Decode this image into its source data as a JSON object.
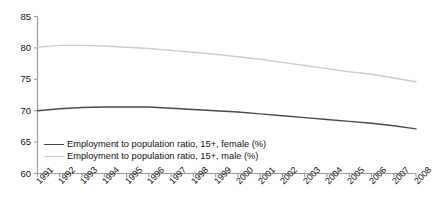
{
  "chart_data": {
    "type": "line",
    "title": "",
    "xlabel": "",
    "ylabel": "",
    "ylim": [
      60,
      85
    ],
    "yticks": [
      60,
      65,
      70,
      75,
      80,
      85
    ],
    "grid": false,
    "legend_position": "bottom-left",
    "x": [
      1991,
      1992,
      1993,
      1994,
      1995,
      1996,
      1997,
      1998,
      1999,
      2000,
      2001,
      2002,
      2003,
      2004,
      2005,
      2006,
      2007,
      2008
    ],
    "categories": [
      "1991",
      "1992",
      "1993",
      "1994",
      "1995",
      "1996",
      "1997",
      "1998",
      "1999",
      "2000",
      "2001",
      "2002",
      "2003",
      "2004",
      "2005",
      "2006",
      "2007",
      "2008"
    ],
    "series": [
      {
        "name": "Employment to population ratio, 15+, female (%)",
        "color": "#4a4a4a",
        "values": [
          70.0,
          70.3,
          70.5,
          70.6,
          70.6,
          70.6,
          70.4,
          70.2,
          70.0,
          69.8,
          69.5,
          69.2,
          68.9,
          68.6,
          68.3,
          68.0,
          67.6,
          67.1
        ]
      },
      {
        "name": "Employment to population ratio, 15+, male (%)",
        "color": "#cdcdcd",
        "values": [
          80.1,
          80.4,
          80.4,
          80.3,
          80.1,
          79.9,
          79.6,
          79.3,
          79.0,
          78.6,
          78.2,
          77.7,
          77.2,
          76.7,
          76.2,
          75.8,
          75.2,
          74.6
        ]
      }
    ]
  },
  "axes": {
    "y_labels": [
      "85",
      "80",
      "75",
      "70",
      "65",
      "60"
    ],
    "x_labels": [
      "1991",
      "1992",
      "1993",
      "1994",
      "1995",
      "1996",
      "1997",
      "1998",
      "1999",
      "2000",
      "2001",
      "2002",
      "2003",
      "2004",
      "2005",
      "2006",
      "2007",
      "2008"
    ]
  },
  "legend": {
    "items": [
      {
        "label": "Employment to population ratio, 15+, female (%)",
        "color": "#4a4a4a"
      },
      {
        "label": "Employment to population ratio, 15+, male (%)",
        "color": "#c9c9c9"
      }
    ]
  }
}
